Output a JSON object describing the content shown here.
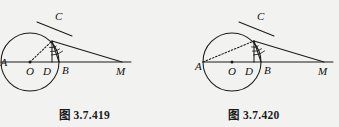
{
  "page": {
    "background_color": "#f2f2f0",
    "ink_color": "#1a1a1a",
    "figure_count": 2
  },
  "figures": [
    {
      "id": "figure-419",
      "caption": "图 3.7.419",
      "caption_prefix": "图",
      "caption_number": "3.7.419",
      "points": [
        {
          "name": "A",
          "label": "A",
          "role": "left-end-of-diameter"
        },
        {
          "name": "O",
          "label": "O",
          "role": "circle-center"
        },
        {
          "name": "D",
          "label": "D",
          "role": "foot-of-perpendicular"
        },
        {
          "name": "B",
          "label": "B",
          "role": "right-end-of-diameter"
        },
        {
          "name": "M",
          "label": "M",
          "role": "external-point-on-line"
        },
        {
          "name": "C",
          "label": "C",
          "role": "point-on-circle"
        }
      ],
      "elements": [
        "circle",
        "diameter-line-A-to-M",
        "tangent-line-at-C",
        "segment-C-D-perpendicular",
        "segment-C-B",
        "segment-C-M",
        "dotted-segment-O-C",
        "angle-arc-marks-at-C"
      ],
      "dotted_segment": "O-C"
    },
    {
      "id": "figure-420",
      "caption": "图 3.7.420",
      "caption_prefix": "图",
      "caption_number": "3.7.420",
      "points": [
        {
          "name": "A",
          "label": "A",
          "role": "left-end-of-diameter"
        },
        {
          "name": "O",
          "label": "O",
          "role": "circle-center"
        },
        {
          "name": "D",
          "label": "D",
          "role": "foot-of-perpendicular"
        },
        {
          "name": "B",
          "label": "B",
          "role": "right-end-of-diameter"
        },
        {
          "name": "M",
          "label": "M",
          "role": "external-point-on-line"
        },
        {
          "name": "C",
          "label": "C",
          "role": "point-on-circle"
        }
      ],
      "elements": [
        "circle",
        "diameter-line-A-to-M",
        "tangent-line-at-C",
        "segment-C-D-perpendicular",
        "segment-C-B",
        "segment-C-M",
        "dotted-segment-A-C",
        "angle-arc-marks-at-C"
      ],
      "dotted_segment": "A-C"
    }
  ]
}
